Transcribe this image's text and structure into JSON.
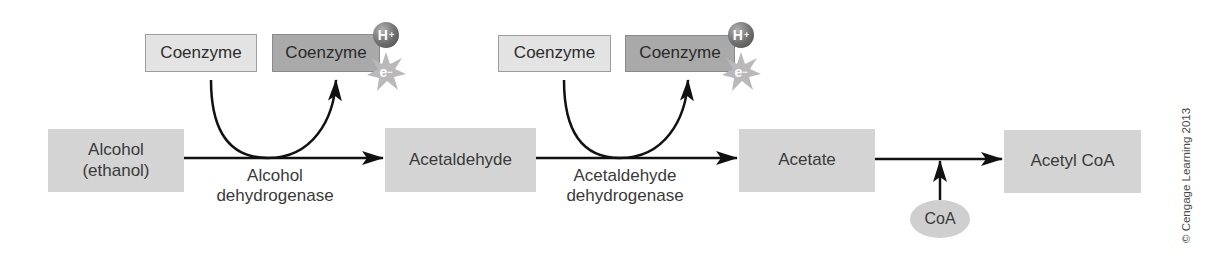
{
  "diagram": {
    "type": "metabolic-pathway",
    "molecules": [
      {
        "id": "alcohol",
        "line1": "Alcohol",
        "line2": "(ethanol)"
      },
      {
        "id": "acetaldehyde",
        "label": "Acetaldehyde"
      },
      {
        "id": "acetate",
        "label": "Acetate"
      },
      {
        "id": "acetyl_coa",
        "label": "Acetyl CoA"
      }
    ],
    "enzymes": [
      {
        "line1": "Alcohol",
        "line2": "dehydrogenase"
      },
      {
        "line1": "Acetaldehyde",
        "line2": "dehydrogenase"
      }
    ],
    "coenzymes": [
      {
        "oxidized": "Coenzyme",
        "reduced": "Coenzyme",
        "hydrogen": "H",
        "hydrogen_charge": "+",
        "electron": "e",
        "electron_charge": "−"
      },
      {
        "oxidized": "Coenzyme",
        "reduced": "Coenzyme",
        "hydrogen": "H",
        "hydrogen_charge": "+",
        "electron": "e",
        "electron_charge": "−"
      }
    ],
    "cofactor": {
      "label": "CoA"
    },
    "copyright": "© Cengage Learning 2013",
    "colors": {
      "molecule_box": "#d4d4d4",
      "coenzyme_oxidized": "#e3e3e3",
      "coenzyme_reduced": "#a9a9a9",
      "arrow": "#111111"
    }
  }
}
